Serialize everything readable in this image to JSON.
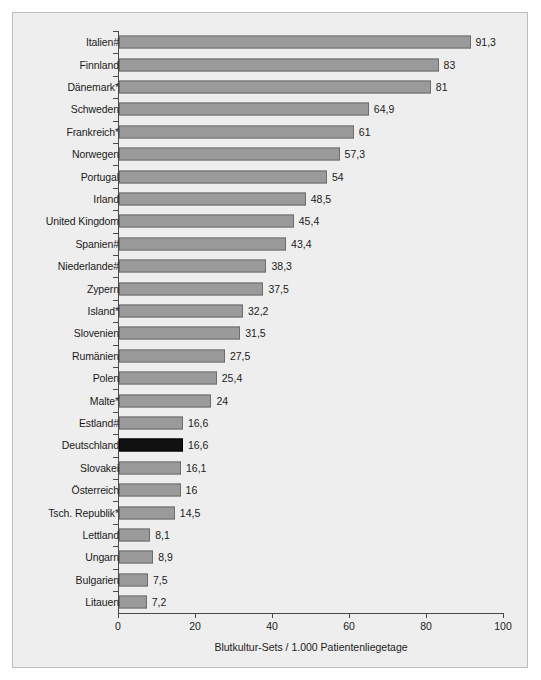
{
  "chart_data": {
    "type": "bar",
    "orientation": "horizontal",
    "title": "",
    "xlabel": "Blutkultur-Sets / 1.000 Patientenliegetage",
    "ylabel": "",
    "xlim": [
      0,
      100
    ],
    "xticks": [
      0,
      20,
      40,
      60,
      80,
      100
    ],
    "xtick_labels": [
      "0",
      "20",
      "40",
      "60",
      "80",
      "100"
    ],
    "grid": false,
    "legend": null,
    "highlight_category": "Deutschland",
    "highlight_color": "#111111",
    "bar_color": "#9a9a9a",
    "bar_edge_color": "#6d6d6d",
    "background_color": "#eeeeee",
    "categories": [
      "Italien#",
      "Finnland",
      "Dänemark*",
      "Schweden",
      "Frankreich*",
      "Norwegen",
      "Portugal",
      "Irland",
      "United Kingdom",
      "Spanien#",
      "Niederlande#",
      "Zypern",
      "Island*",
      "Slovenien",
      "Rumänien",
      "Polen",
      "Malte*",
      "Estland#",
      "Deutschland",
      "Slovakei",
      "Österreich",
      "Tsch. Republik*",
      "Lettland",
      "Ungarn",
      "Bulgarien",
      "Litauen"
    ],
    "values": [
      91.3,
      83,
      81,
      64.9,
      61,
      57.3,
      54,
      48.5,
      45.4,
      43.4,
      38.3,
      37.5,
      32.2,
      31.5,
      27.5,
      25.4,
      24,
      16.6,
      16.6,
      16.1,
      16,
      14.5,
      8.1,
      8.9,
      7.5,
      7.2
    ],
    "value_labels": [
      "91,3",
      "83",
      "81",
      "64,9",
      "61",
      "57,3",
      "54",
      "48,5",
      "45,4",
      "43,4",
      "38,3",
      "37,5",
      "32,2",
      "31,5",
      "27,5",
      "25,4",
      "24",
      "16,6",
      "16,6",
      "16,1",
      "16",
      "14,5",
      "8,1",
      "8,9",
      "7,5",
      "7,2"
    ]
  }
}
